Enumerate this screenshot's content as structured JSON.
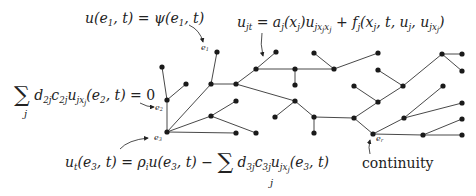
{
  "diagram": {
    "type": "network-graph-with-boundary-conditions",
    "equations": {
      "dirichlet": "u(e1,t) = ψ(e1,t)",
      "pde": "u_jt = a_j(x_j) u_{j x_j x_j} + f_j(x_j, t, u_j, u_{j x_j})",
      "neumann": "Σ_j d_2j c_2j u_{j x_j}(e2,t) = 0",
      "robin": "u_t(e3,t) = ρ_i u(e3,t) − Σ_j d_3j c_3j u_{j x_j}(e3,t)"
    },
    "node_labels": {
      "e1": "e",
      "e1_sub": "1",
      "e2": "e",
      "e2_sub": "2",
      "e3": "e",
      "e3_sub": "3",
      "er": "e",
      "er_sub": "r"
    },
    "annotation": {
      "continuity": "continuity"
    },
    "colors": {
      "ink": "#222222",
      "background": "#ffffff"
    }
  }
}
